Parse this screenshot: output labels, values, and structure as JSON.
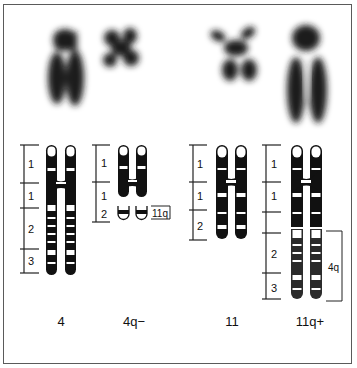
{
  "figure": {
    "colors": {
      "border": "#5a5a5a",
      "band_dark": "#111111",
      "band_light": "#ffffff",
      "micrograph": "#1a1a1a"
    },
    "chromosomes": [
      {
        "id": "4",
        "label": "4",
        "region_labels": [
          "1",
          "1",
          "2",
          "3"
        ]
      },
      {
        "id": "4q-",
        "label": "4q−",
        "region_labels": [
          "1",
          "1",
          "2"
        ],
        "bracket_label": "11q"
      },
      {
        "id": "11",
        "label": "11",
        "region_labels": [
          "1",
          "1",
          "2"
        ]
      },
      {
        "id": "11q+",
        "label": "11q+",
        "region_labels": [
          "1",
          "1",
          "2",
          "3"
        ],
        "bracket_label": "4q"
      }
    ]
  }
}
